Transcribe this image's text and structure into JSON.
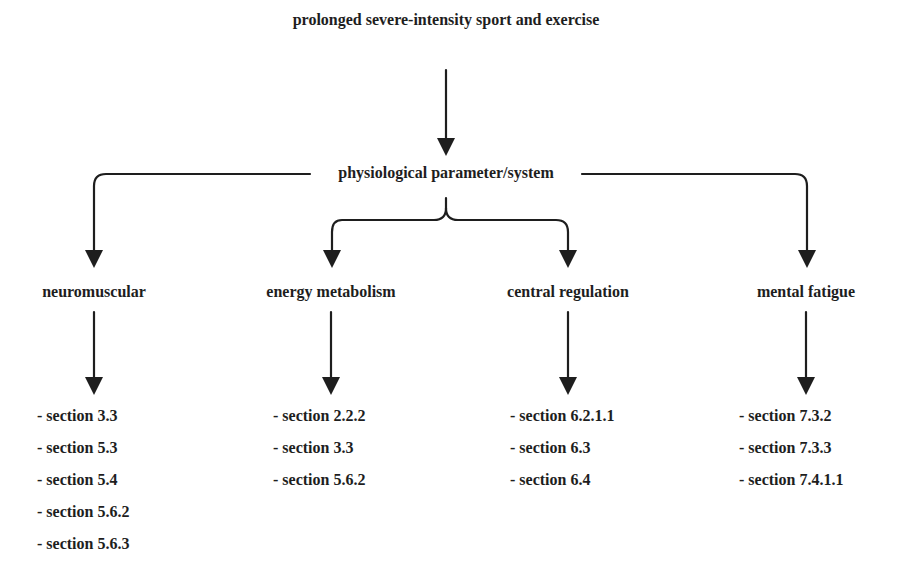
{
  "diagram": {
    "root": {
      "label": "prolonged severe-intensity sport and exercise"
    },
    "hub": {
      "label": "physiological parameter/system"
    },
    "categories": [
      {
        "label": "neuromuscular",
        "sections": [
          "- section 3.3",
          "- section 5.3",
          "- section 5.4",
          "- section 5.6.2",
          "- section 5.6.3"
        ]
      },
      {
        "label": "energy metabolism",
        "sections": [
          "- section 2.2.2",
          "- section 3.3",
          "- section 5.6.2"
        ]
      },
      {
        "label": "central regulation",
        "sections": [
          "- section 6.2.1.1",
          "- section 6.3",
          "- section 6.4"
        ]
      },
      {
        "label": "mental fatigue",
        "sections": [
          "- section 7.3.2",
          "- section 7.3.3",
          "- section 7.4.1.1"
        ]
      }
    ],
    "colors": {
      "line": "#1e1e1e",
      "text": "#1e1e1e",
      "background": "#ffffff"
    }
  }
}
